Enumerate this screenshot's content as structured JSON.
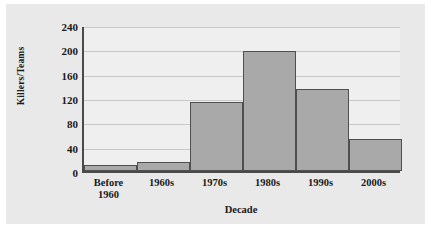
{
  "chart_data": {
    "type": "bar",
    "title": "",
    "xlabel": "Decade",
    "ylabel": "Killers/Teams",
    "categories": [
      "Before 1960",
      "1960s",
      "1970s",
      "1980s",
      "1990s",
      "2000s"
    ],
    "category_lines": [
      [
        "Before",
        "1960"
      ],
      [
        "1960s"
      ],
      [
        "1970s"
      ],
      [
        "1980s"
      ],
      [
        "1990s"
      ],
      [
        "2000s"
      ]
    ],
    "values": [
      10,
      15,
      114,
      197,
      135,
      53
    ],
    "ylim": [
      0,
      240
    ],
    "yticks": [
      0,
      40,
      80,
      120,
      160,
      200,
      240
    ],
    "ytick_labels": [
      "0",
      "40",
      "80",
      "120",
      "160",
      "200",
      "240"
    ],
    "grid": true,
    "legend": false,
    "bar_color": "#a9a9a9",
    "bar_edge_color": "#4f4f4f",
    "axis_color": "#4a4a4a",
    "grid_color": "#c8c8c8",
    "plot_background": "#efefef",
    "figure_background": "#e9e9e9",
    "page_background": "#ffffff"
  }
}
